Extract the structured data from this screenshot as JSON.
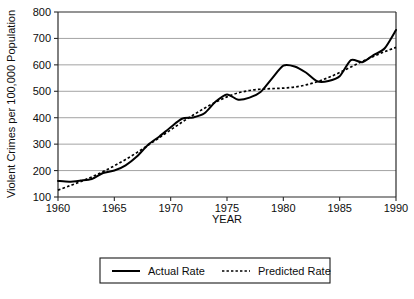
{
  "chart_data": {
    "type": "line",
    "title": "",
    "xlabel": "YEAR",
    "ylabel": "Violent Crimes per 100,000 Population",
    "xlim": [
      1960,
      1990
    ],
    "ylim": [
      100,
      800
    ],
    "xticks": [
      1960,
      1965,
      1970,
      1975,
      1980,
      1985,
      1990
    ],
    "xtick_labels": [
      "1960",
      "1965",
      "1970",
      "1975",
      "1980",
      "1985",
      "1990"
    ],
    "yticks": [
      100,
      200,
      300,
      400,
      500,
      600,
      700,
      800
    ],
    "ytick_labels": [
      "100",
      "200",
      "300",
      "400",
      "500",
      "600",
      "700",
      "800"
    ],
    "grid": true,
    "grid_axis": "y",
    "legend_position": "below-plot",
    "x": [
      1960,
      1961,
      1962,
      1963,
      1964,
      1965,
      1966,
      1967,
      1968,
      1969,
      1970,
      1971,
      1972,
      1973,
      1974,
      1975,
      1976,
      1977,
      1978,
      1979,
      1980,
      1981,
      1982,
      1983,
      1984,
      1985,
      1986,
      1987,
      1988,
      1989,
      1990
    ],
    "series": [
      {
        "name": "Actual Rate",
        "style": "solid",
        "color": "#000000",
        "values": [
          161,
          158,
          162,
          168,
          191,
          200,
          220,
          253,
          298,
          329,
          364,
          396,
          401,
          417,
          461,
          488,
          468,
          476,
          498,
          549,
          597,
          594,
          571,
          538,
          539,
          557,
          618,
          610,
          637,
          663,
          732
        ]
      },
      {
        "name": "Predicted Rate",
        "style": "dotted",
        "color": "#000000",
        "values": [
          126,
          142,
          158,
          176,
          196,
          218,
          242,
          268,
          296,
          325,
          354,
          383,
          410,
          436,
          459,
          479,
          494,
          503,
          508,
          510,
          512,
          516,
          524,
          536,
          552,
          571,
          592,
          613,
          632,
          650,
          666
        ]
      }
    ]
  },
  "legend": {
    "items": [
      {
        "label": "Actual Rate",
        "style": "solid"
      },
      {
        "label": "Predicted Rate",
        "style": "dotted"
      }
    ]
  }
}
